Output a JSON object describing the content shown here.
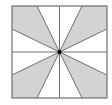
{
  "diagram": {
    "type": "geometric-figure",
    "square": {
      "x1": 12,
      "y1": 6,
      "x2": 107,
      "y2": 98
    },
    "center": {
      "x": 59.5,
      "y": 52
    },
    "edge_points": {
      "top": [
        37,
        59.5,
        82
      ],
      "bottom": [
        37,
        59.5,
        82
      ],
      "left": [
        29,
        52,
        75
      ],
      "right": [
        29,
        52,
        75
      ]
    },
    "colors": {
      "shade": "#d3d3d3",
      "line": "#6e6e6e",
      "border": "#6e6e6e",
      "center_dot": "#000000",
      "background": "#ffffff"
    },
    "shaded_regions": [
      {
        "name": "top-left",
        "points": [
          [
            12,
            6
          ],
          [
            37,
            6
          ],
          [
            59.5,
            52
          ],
          [
            12,
            29
          ]
        ]
      },
      {
        "name": "top-right",
        "points": [
          [
            82,
            6
          ],
          [
            107,
            6
          ],
          [
            107,
            29
          ],
          [
            59.5,
            52
          ]
        ]
      },
      {
        "name": "bottom-left",
        "points": [
          [
            12,
            75
          ],
          [
            59.5,
            52
          ],
          [
            37,
            98
          ],
          [
            12,
            98
          ]
        ]
      },
      {
        "name": "bottom-right",
        "points": [
          [
            59.5,
            52
          ],
          [
            107,
            75
          ],
          [
            107,
            98
          ],
          [
            82,
            98
          ]
        ]
      }
    ]
  }
}
